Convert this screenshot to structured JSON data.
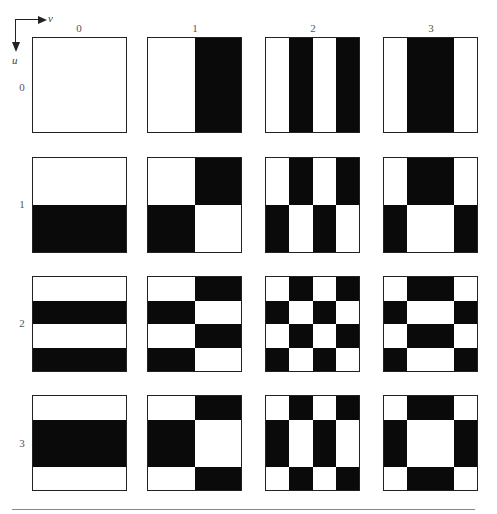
{
  "figure": {
    "axes": {
      "horizontal_label": "v",
      "vertical_label": "u"
    },
    "column_labels": [
      "0",
      "1",
      "2",
      "3"
    ],
    "row_labels": [
      "0",
      "1",
      "2",
      "3"
    ],
    "colors": {
      "black": "#0a0a0a",
      "white": "#ffffff",
      "border": "#222222",
      "label": "#555555"
    },
    "geometry": {
      "col_left": [
        32,
        147,
        265,
        383
      ],
      "col_width": 95,
      "row_top": [
        37,
        157,
        276,
        395
      ],
      "row_height": 96
    },
    "basis_1d": {
      "0": [
        "W",
        "W",
        "W",
        "W"
      ],
      "1": [
        "W",
        "W",
        "B",
        "B"
      ],
      "2": [
        "W",
        "B",
        "W",
        "B"
      ],
      "3": [
        "W",
        "B",
        "B",
        "W"
      ]
    },
    "patches": [
      {
        "u": 0,
        "v": 0,
        "grid": [
          "WWWW",
          "WWWW",
          "WWWW",
          "WWWW"
        ]
      },
      {
        "u": 0,
        "v": 1,
        "grid": [
          "WWBB",
          "WWBB",
          "WWBB",
          "WWBB"
        ]
      },
      {
        "u": 0,
        "v": 2,
        "grid": [
          "WBWB",
          "WBWB",
          "WBWB",
          "WBWB"
        ]
      },
      {
        "u": 0,
        "v": 3,
        "grid": [
          "WBBW",
          "WBBW",
          "WBBW",
          "WBBW"
        ]
      },
      {
        "u": 1,
        "v": 0,
        "grid": [
          "WWWW",
          "WWWW",
          "BBBB",
          "BBBB"
        ]
      },
      {
        "u": 1,
        "v": 1,
        "grid": [
          "WWBB",
          "WWBB",
          "BBWW",
          "BBWW"
        ]
      },
      {
        "u": 1,
        "v": 2,
        "grid": [
          "WBWB",
          "WBWB",
          "BWBW",
          "BWBW"
        ]
      },
      {
        "u": 1,
        "v": 3,
        "grid": [
          "WBBW",
          "WBBW",
          "BWWB",
          "BWWB"
        ]
      },
      {
        "u": 2,
        "v": 0,
        "grid": [
          "WWWW",
          "BBBB",
          "WWWW",
          "BBBB"
        ]
      },
      {
        "u": 2,
        "v": 1,
        "grid": [
          "WWBB",
          "BBWW",
          "WWBB",
          "BBWW"
        ]
      },
      {
        "u": 2,
        "v": 2,
        "grid": [
          "WBWB",
          "BWBW",
          "WBWB",
          "BWBW"
        ]
      },
      {
        "u": 2,
        "v": 3,
        "grid": [
          "WBBW",
          "BWWB",
          "WBBW",
          "BWWB"
        ]
      },
      {
        "u": 3,
        "v": 0,
        "grid": [
          "WWWW",
          "BBBB",
          "BBBB",
          "WWWW"
        ]
      },
      {
        "u": 3,
        "v": 1,
        "grid": [
          "WWBB",
          "BBWW",
          "BBWW",
          "WWBB"
        ]
      },
      {
        "u": 3,
        "v": 2,
        "grid": [
          "WBWB",
          "BWBW",
          "BWBW",
          "WBWB"
        ]
      },
      {
        "u": 3,
        "v": 3,
        "grid": [
          "WBBW",
          "BWWB",
          "BWWB",
          "WBBW"
        ]
      }
    ]
  }
}
